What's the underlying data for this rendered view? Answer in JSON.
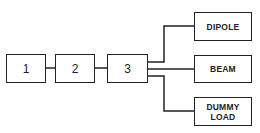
{
  "diagram": {
    "chain": [
      {
        "id": "block-1",
        "label": "1"
      },
      {
        "id": "block-2",
        "label": "2"
      },
      {
        "id": "block-3",
        "label": "3"
      }
    ],
    "outputs": [
      {
        "id": "dipole",
        "label": "DIPOLE"
      },
      {
        "id": "beam",
        "label": "BEAM"
      },
      {
        "id": "dummy-load",
        "label_line1": "DUMMY",
        "label_line2": "LOAD"
      }
    ],
    "colors": {
      "line": "#222222",
      "background": "#ffffff"
    }
  }
}
